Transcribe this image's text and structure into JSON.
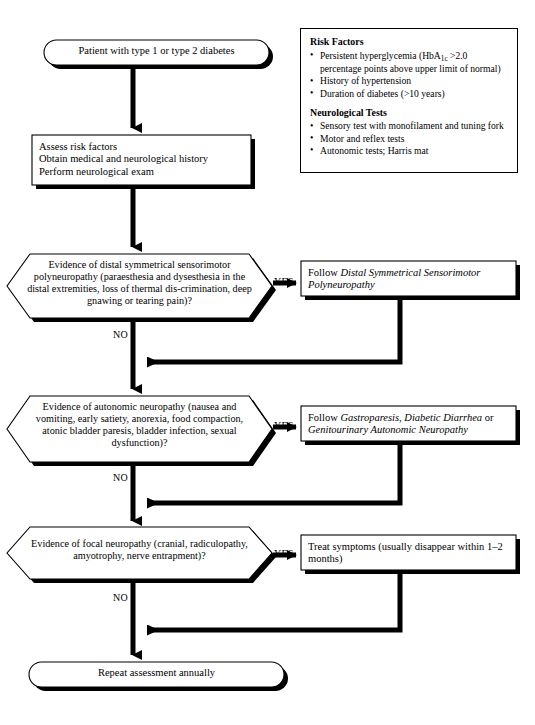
{
  "diagram": {
    "colors": {
      "stroke": "#000000",
      "fill": "#ffffff",
      "shadow": "#000000"
    },
    "nodes": {
      "start": {
        "shape": "terminal",
        "label": "Patient with type 1 or type 2 diabetes"
      },
      "assess": {
        "shape": "process",
        "label": "Assess risk factors\nObtain medical and neurological history\nPerform neurological exam"
      },
      "decision_dspn": {
        "shape": "decision",
        "label": "Evidence of distal symmetrical sensorimotor polyneuropathy (paraesthesia and dysesthesia in the distal extremities, loss of thermal dis-crimination, deep gnawing or tearing pain)?"
      },
      "follow_dspn": {
        "shape": "process",
        "prefix": "Follow ",
        "italic": "Distal Symmetrical Sensorimotor Polyneuropathy"
      },
      "decision_autonomic": {
        "shape": "decision",
        "label": "Evidence of autonomic neuropathy (nausea and vomiting, early satiety, anorexia, food compaction, atonic bladder paresis, bladder infection, sexual dysfunction)?"
      },
      "follow_autonomic": {
        "shape": "process",
        "prefix": "Follow ",
        "italic_a": "Gastroparesis, Diabetic Diarrhea",
        "mid": " or ",
        "italic_b": "Genitourinary Autonomic Neuropathy"
      },
      "decision_focal": {
        "shape": "decision",
        "label": "Evidence of focal neuropathy (cranial, radiculopathy, amyotrophy, nerve entrapment)?"
      },
      "treat_focal": {
        "shape": "process",
        "label": "Treat symptoms (usually disappear within 1–2 months)"
      },
      "end": {
        "shape": "terminal",
        "label": "Repeat assessment annually"
      }
    },
    "edge_labels": {
      "yes_1": "YES",
      "yes_2": "YES",
      "yes_3": "YES",
      "no_1": "NO",
      "no_2": "NO",
      "no_3": "NO"
    }
  },
  "info_panel": {
    "risk_factors": {
      "heading": "Risk Factors",
      "items": [
        {
          "pre": "Persistent hyperglycemia (HbA",
          "subscript": "1c",
          "post": " >2.0 percentage points above upper limit of normal)"
        },
        {
          "pre": "History of hypertension",
          "subscript": "",
          "post": ""
        },
        {
          "pre": "Duration of diabetes (>10 years)",
          "subscript": "",
          "post": ""
        }
      ]
    },
    "neurological_tests": {
      "heading": "Neurological Tests",
      "items": [
        "Sensory test with monofilament and tuning fork",
        "Motor and reflex tests",
        "Autonomic tests; Harris mat"
      ]
    }
  }
}
